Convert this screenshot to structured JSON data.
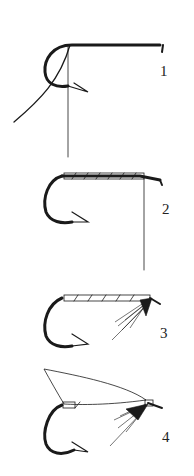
{
  "figure": {
    "steps": [
      {
        "label": "1",
        "content": "bare hook with thread attached"
      },
      {
        "label": "2",
        "content": "thread wrapped along hook shank"
      },
      {
        "label": "3",
        "content": "hackle fibers tied in at head"
      },
      {
        "label": "4",
        "content": "wing added above hook"
      }
    ],
    "colors": {
      "ink": "#1a1a1a",
      "background": "#ffffff"
    }
  }
}
